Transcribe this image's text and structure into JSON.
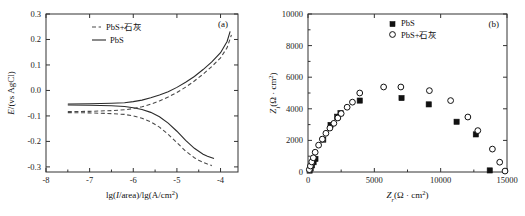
{
  "figure": {
    "panel_a_tag": "(a)",
    "panel_b_tag": "(b)"
  },
  "panel_a": {
    "tag": "(a)",
    "xlabel_parts": {
      "main": "lg(",
      "i": "I",
      "mid": "/area)/lg(A/cm",
      "sup": "2",
      "end": ")"
    },
    "xlabel": "lg(I/area)/lg(A/cm2)",
    "ylabel": "E/(vs AgCl)",
    "ylabel_italic": "E",
    "ylabel_rest": "/(vs AgCl)",
    "legend": [
      {
        "label": "PbS+石灰",
        "style": "dashed"
      },
      {
        "label": "PbS",
        "style": "solid"
      }
    ],
    "xticks": [
      "-8",
      "-7",
      "-6",
      "-5",
      "-4"
    ],
    "yticks": [
      "0.3",
      "0.2",
      "0.1",
      "0.0",
      "-0.1",
      "-0.2",
      "-0.3"
    ],
    "chart_data": {
      "type": "line",
      "title": "",
      "xlabel": "lg(I/area)/lg(A/cm2)",
      "ylabel": "E/(vs AgCl)",
      "xlim": [
        -8,
        -3.6
      ],
      "ylim": [
        -0.32,
        0.3
      ],
      "grid": false,
      "legend_position": "upper-left-inside",
      "series": [
        {
          "name": "PbS",
          "style": "solid",
          "corrosion_potential": -0.055,
          "branches": [
            {
              "name": "anodic",
              "x": [
                -7.5,
                -7.0,
                -6.5,
                -6.2,
                -6.0,
                -5.8,
                -5.6,
                -5.4,
                -5.2,
                -5.0,
                -4.8,
                -4.6,
                -4.4,
                -4.2,
                -4.0,
                -3.85,
                -3.78
              ],
              "y": [
                -0.053,
                -0.052,
                -0.05,
                -0.048,
                -0.044,
                -0.038,
                -0.029,
                -0.018,
                -0.005,
                0.012,
                0.032,
                0.055,
                0.082,
                0.112,
                0.148,
                0.192,
                0.232
              ]
            },
            {
              "name": "cathodic",
              "x": [
                -7.5,
                -7.0,
                -6.5,
                -6.2,
                -6.0,
                -5.8,
                -5.6,
                -5.4,
                -5.2,
                -5.0,
                -4.8,
                -4.6,
                -4.4,
                -4.3,
                -4.2,
                -4.15
              ],
              "y": [
                -0.057,
                -0.058,
                -0.06,
                -0.063,
                -0.068,
                -0.075,
                -0.086,
                -0.103,
                -0.128,
                -0.16,
                -0.196,
                -0.227,
                -0.25,
                -0.258,
                -0.264,
                -0.267
              ]
            }
          ]
        },
        {
          "name": "PbS+石灰",
          "style": "dashed",
          "corrosion_potential": -0.085,
          "branches": [
            {
              "name": "anodic",
              "x": [
                -7.5,
                -7.0,
                -6.5,
                -6.2,
                -6.0,
                -5.8,
                -5.6,
                -5.4,
                -5.2,
                -5.0,
                -4.8,
                -4.6,
                -4.4,
                -4.2,
                -4.0,
                -3.85,
                -3.75
              ],
              "y": [
                -0.083,
                -0.082,
                -0.079,
                -0.076,
                -0.071,
                -0.064,
                -0.054,
                -0.041,
                -0.026,
                -0.008,
                0.013,
                0.037,
                0.064,
                0.094,
                0.128,
                0.168,
                0.218
              ]
            },
            {
              "name": "cathodic",
              "x": [
                -7.5,
                -7.0,
                -6.5,
                -6.2,
                -6.0,
                -5.8,
                -5.6,
                -5.4,
                -5.2,
                -5.0,
                -4.8,
                -4.6,
                -4.5,
                -4.4,
                -4.3,
                -4.2
              ],
              "y": [
                -0.087,
                -0.088,
                -0.091,
                -0.094,
                -0.1,
                -0.109,
                -0.123,
                -0.144,
                -0.172,
                -0.205,
                -0.238,
                -0.264,
                -0.274,
                -0.282,
                -0.289,
                -0.295
              ]
            }
          ]
        }
      ]
    }
  },
  "panel_b": {
    "tag": "(b)",
    "xlabel": "Zr(Ω·cm2)",
    "ylabel": "Zi(Ω·cm2)",
    "xlabel_parts": {
      "z": "Z",
      "sub": "r",
      "open": "(Ω · cm",
      "sup": "2",
      "close": ")"
    },
    "ylabel_parts": {
      "z": "Z",
      "sub": "i",
      "open": "(Ω · cm",
      "sup": "2",
      "close": ")"
    },
    "legend": [
      {
        "label": "PbS",
        "marker": "filled-square"
      },
      {
        "label": "PbS+石灰",
        "marker": "open-circle"
      }
    ],
    "xticks": [
      "0",
      "5000",
      "10000",
      "15000"
    ],
    "yticks": [
      "0",
      "2000",
      "4000",
      "6000",
      "8000",
      "10000"
    ],
    "chart_data": {
      "type": "scatter",
      "title": "",
      "xlabel": "Zr(Ω·cm2)",
      "ylabel": "Zi(Ω·cm2)",
      "xlim": [
        0,
        15000
      ],
      "ylim": [
        0,
        10000
      ],
      "grid": false,
      "legend_position": "upper-center",
      "series": [
        {
          "name": "PbS",
          "marker": "filled-square",
          "points": [
            [
              120,
              90
            ],
            [
              200,
              230
            ],
            [
              300,
              420
            ],
            [
              420,
              620
            ],
            [
              560,
              830
            ],
            [
              1150,
              2050
            ],
            [
              1700,
              2980
            ],
            [
              2200,
              3500
            ],
            [
              2450,
              3720
            ],
            [
              3900,
              4520
            ],
            [
              7050,
              4680
            ],
            [
              9100,
              4280
            ],
            [
              11200,
              3180
            ],
            [
              12650,
              2380
            ],
            [
              13700,
              100
            ]
          ]
        },
        {
          "name": "PbS+石灰",
          "marker": "open-circle",
          "points": [
            [
              100,
              150
            ],
            [
              180,
              380
            ],
            [
              280,
              640
            ],
            [
              400,
              900
            ],
            [
              540,
              1250
            ],
            [
              800,
              1700
            ],
            [
              1080,
              2080
            ],
            [
              1350,
              2450
            ],
            [
              1650,
              2780
            ],
            [
              1950,
              3080
            ],
            [
              2250,
              3420
            ],
            [
              2500,
              3700
            ],
            [
              2950,
              4100
            ],
            [
              3350,
              4420
            ],
            [
              3900,
              5000
            ],
            [
              5700,
              5380
            ],
            [
              7000,
              5380
            ],
            [
              9150,
              5150
            ],
            [
              10750,
              4520
            ],
            [
              12050,
              3480
            ],
            [
              12800,
              2620
            ],
            [
              13900,
              1450
            ],
            [
              14450,
              620
            ],
            [
              14850,
              60
            ]
          ]
        }
      ]
    }
  }
}
